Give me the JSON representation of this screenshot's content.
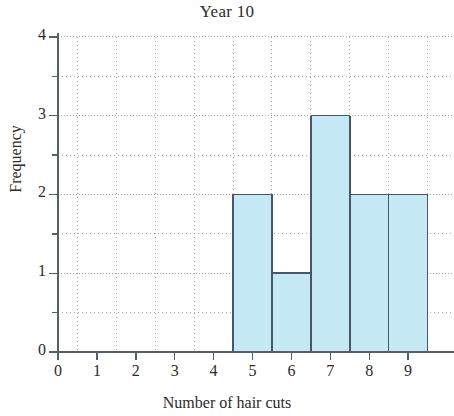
{
  "chart_data": {
    "type": "bar",
    "title": "Year 10",
    "xlabel": "Number of hair cuts",
    "ylabel": "Frequency",
    "categories": [
      0,
      1,
      2,
      3,
      4,
      5,
      6,
      7,
      8,
      9
    ],
    "values": [
      0,
      0,
      0,
      0,
      0,
      2,
      1,
      3,
      2,
      2
    ],
    "xtick_labels": [
      "0",
      "1",
      "2",
      "3",
      "4",
      "5",
      "6",
      "7",
      "8",
      "9"
    ],
    "ytick_labels": [
      "0",
      "1",
      "2",
      "3",
      "4"
    ],
    "xlim": [
      -0.5,
      9.5
    ],
    "ylim": [
      0,
      4
    ],
    "ymajor_step": 1,
    "yminor_step": 0.5,
    "grid": true,
    "grid_style": "dotted",
    "legend": false,
    "bar_width": 1,
    "bar_fill": "#c5e8f5",
    "bar_edge": "#45576b",
    "axis_color": "#555f68",
    "grid_color": "#aaaaaa",
    "note": "histogram bars span half-integer boundaries; rightmost bar clipped at image edge"
  },
  "axes": {
    "title": "Year 10",
    "x_axis_title": "Number of hair cuts",
    "y_axis_title": "Frequency"
  }
}
